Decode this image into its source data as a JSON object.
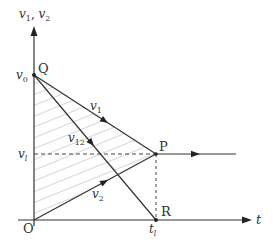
{
  "diagram": {
    "type": "velocity-time graph",
    "axes": {
      "y_label_a": "v",
      "y_sub_a": "1",
      "y_sep": ", ",
      "y_label_b": "v",
      "y_sub_b": "2",
      "x_label": "t",
      "origin_label": "O"
    },
    "ticks": {
      "v0_main": "v",
      "v0_sub": "0",
      "vl_main": "v",
      "vl_sub": "l",
      "tl_main": "t",
      "tl_sub": "l"
    },
    "points": {
      "Q": "Q",
      "P": "P",
      "R": "R"
    },
    "lines": {
      "v1_main": "v",
      "v1_sub": "1",
      "v2_main": "v",
      "v2_sub": "2",
      "v12_main": "v",
      "v12_sub": "12"
    },
    "colors": {
      "stroke": "#333333",
      "hatch": "#888888",
      "background": "#ffffff"
    }
  }
}
